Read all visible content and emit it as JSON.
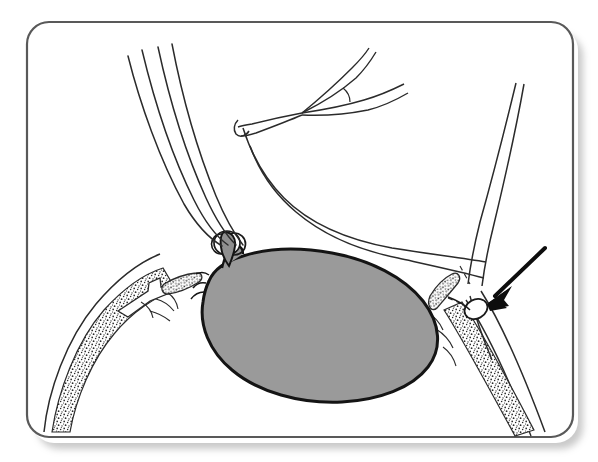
{
  "figure": {
    "title": "Surgical line drawing: ligated mass with instruments",
    "kind": "medical-line-illustration",
    "frame": {
      "x": 27,
      "y": 22,
      "width": 546,
      "height": 415,
      "corner_radius": 22,
      "stroke_color": "#595959",
      "stroke_width": 2.2,
      "fill_color": "#ffffff",
      "shadow": "true"
    },
    "colors": {
      "ink": "#1a1a1a",
      "line": "#2b2b2b",
      "mass_fill": "#9a9a9a",
      "mass_outline": "#141414",
      "stipple": "#2a2a2a",
      "paper": "#ffffff",
      "frame": "#595959"
    },
    "elements": [
      {
        "name": "suture-bundle-upper-left",
        "label": "Four parallel suture / vessel strands entering from upper left",
        "strand_count": 4
      },
      {
        "name": "ligature-knot",
        "label": "Ligature knot tied at apex of mass"
      },
      {
        "name": "gray-mass",
        "label": "Shaded ovoid mass (specimen)"
      },
      {
        "name": "forked-vessel-upper-middle",
        "label": "Bifurcating tubular structure at upper middle"
      },
      {
        "name": "curved-tube-right",
        "label": "Curved tubular structure descending to the right"
      },
      {
        "name": "right-instrument-shaft",
        "label": "Narrow instrument shaft descending from upper right"
      },
      {
        "name": "clip-loop",
        "label": "Small oval clip / loop indicated by the arrow"
      },
      {
        "name": "pointer-arrow",
        "label": "Solid black arrow pointing down-left to the clip"
      },
      {
        "name": "stippled-tissue-left",
        "label": "Stippled tissue band on the lower left"
      },
      {
        "name": "stippled-tissue-right",
        "label": "Stippled tissue band on the lower right"
      }
    ]
  }
}
